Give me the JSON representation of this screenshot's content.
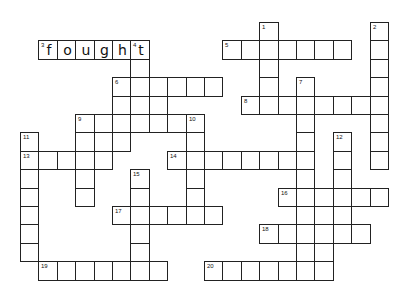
{
  "puzzle": {
    "type": "crossword",
    "grid_origin": {
      "x": 20,
      "y": 22
    },
    "cell_size": 18.4,
    "words": [
      {
        "number": 1,
        "direction": "down",
        "row": 0,
        "col": 13,
        "length": 5,
        "answer": ""
      },
      {
        "number": 2,
        "direction": "down",
        "row": 0,
        "col": 19,
        "length": 8,
        "answer": ""
      },
      {
        "number": 3,
        "direction": "across",
        "row": 1,
        "col": 1,
        "length": 6,
        "answer": "fought"
      },
      {
        "number": 4,
        "direction": "down",
        "row": 1,
        "col": 6,
        "length": 5,
        "answer": "t"
      },
      {
        "number": 5,
        "direction": "across",
        "row": 1,
        "col": 11,
        "length": 7,
        "answer": ""
      },
      {
        "number": 6,
        "direction": "across",
        "row": 3,
        "col": 5,
        "length": 6,
        "answer": ""
      },
      {
        "number": 7,
        "direction": "down",
        "row": 3,
        "col": 15,
        "length": 11,
        "answer": ""
      },
      {
        "number": 8,
        "direction": "across",
        "row": 4,
        "col": 12,
        "length": 8,
        "answer": ""
      },
      {
        "number": 9,
        "direction": "across",
        "row": 5,
        "col": 3,
        "length": 7,
        "answer": ""
      },
      {
        "number": 10,
        "direction": "down",
        "row": 5,
        "col": 9,
        "length": 6,
        "answer": ""
      },
      {
        "number": 11,
        "direction": "down",
        "row": 6,
        "col": 0,
        "length": 7,
        "answer": ""
      },
      {
        "number": 12,
        "direction": "down",
        "row": 6,
        "col": 17,
        "length": 6,
        "answer": ""
      },
      {
        "number": 13,
        "direction": "across",
        "row": 7,
        "col": 0,
        "length": 5,
        "answer": ""
      },
      {
        "number": 14,
        "direction": "across",
        "row": 7,
        "col": 8,
        "length": 8,
        "answer": ""
      },
      {
        "number": 15,
        "direction": "down",
        "row": 8,
        "col": 6,
        "length": 6,
        "answer": ""
      },
      {
        "number": 16,
        "direction": "across",
        "row": 9,
        "col": 14,
        "length": 6,
        "answer": ""
      },
      {
        "number": 17,
        "direction": "across",
        "row": 10,
        "col": 5,
        "length": 6,
        "answer": ""
      },
      {
        "number": 18,
        "direction": "across",
        "row": 11,
        "col": 13,
        "length": 6,
        "answer": ""
      },
      {
        "number": 19,
        "direction": "across",
        "row": 13,
        "col": 1,
        "length": 7,
        "answer": ""
      },
      {
        "number": 20,
        "direction": "across",
        "row": 13,
        "col": 10,
        "length": 7,
        "answer": ""
      }
    ],
    "extra_cells": [
      {
        "row": 6,
        "col": 3
      },
      {
        "row": 6,
        "col": 4
      },
      {
        "row": 6,
        "col": 5
      },
      {
        "row": 8,
        "col": 3
      },
      {
        "row": 9,
        "col": 3
      },
      {
        "row": 4,
        "col": 5
      },
      {
        "row": 4,
        "col": 7
      },
      {
        "row": 10,
        "col": 16
      },
      {
        "row": 12,
        "col": 16
      }
    ],
    "filled_letters": [
      {
        "row": 1,
        "col": 1,
        "letter": "f"
      },
      {
        "row": 1,
        "col": 2,
        "letter": "o"
      },
      {
        "row": 1,
        "col": 3,
        "letter": "u"
      },
      {
        "row": 1,
        "col": 4,
        "letter": "g"
      },
      {
        "row": 1,
        "col": 5,
        "letter": "h"
      },
      {
        "row": 1,
        "col": 6,
        "letter": "t"
      }
    ]
  }
}
